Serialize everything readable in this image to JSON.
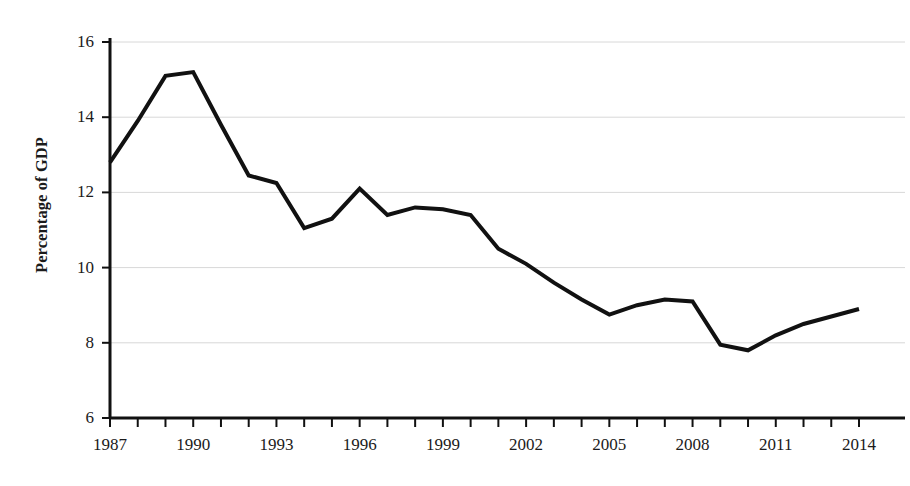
{
  "chart_data": {
    "type": "line",
    "title": "",
    "subtitle": "",
    "xlabel": "",
    "ylabel": "Percentage of GDP",
    "xlim": [
      1987,
      2014
    ],
    "ylim": [
      6,
      16
    ],
    "grid": true,
    "legend": "none",
    "y_ticks": [
      6,
      8,
      10,
      12,
      14,
      16
    ],
    "y_tick_labels": [
      "6",
      "8",
      "10",
      "12",
      "14",
      "16"
    ],
    "x_ticks": [
      1987,
      1988,
      1989,
      1990,
      1991,
      1992,
      1993,
      1994,
      1995,
      1996,
      1997,
      1998,
      1999,
      2000,
      2001,
      2002,
      2003,
      2004,
      2005,
      2006,
      2007,
      2008,
      2009,
      2010,
      2011,
      2012,
      2013,
      2014
    ],
    "x_tick_labels": [
      "1987",
      "1990",
      "1993",
      "1996",
      "1999",
      "2002",
      "2005",
      "2008",
      "2011",
      "2014"
    ],
    "x_tick_label_years": [
      1987,
      1990,
      1993,
      1996,
      1999,
      2002,
      2005,
      2008,
      2011,
      2014
    ],
    "x": [
      1987,
      1988,
      1989,
      1990,
      1991,
      1992,
      1993,
      1994,
      1995,
      1996,
      1997,
      1998,
      1999,
      2000,
      2001,
      2002,
      2003,
      2004,
      2005,
      2006,
      2007,
      2008,
      2009,
      2010,
      2011,
      2012,
      2013,
      2014
    ],
    "values": [
      12.8,
      13.9,
      15.1,
      15.2,
      13.8,
      12.45,
      12.25,
      11.05,
      11.3,
      12.1,
      11.4,
      11.6,
      11.55,
      11.4,
      10.5,
      10.1,
      9.6,
      9.15,
      8.75,
      9.0,
      9.15,
      9.1,
      7.95,
      7.8,
      8.2,
      8.5,
      8.7,
      8.9
    ],
    "series_name": "Percentage of GDP",
    "line_color": "#111111",
    "line_width": 4,
    "grid_color": "#d8d8d8",
    "axis_color": "#111111",
    "background_color": "#ffffff"
  },
  "axes": {
    "y_axis_title": "Percentage of GDP"
  }
}
